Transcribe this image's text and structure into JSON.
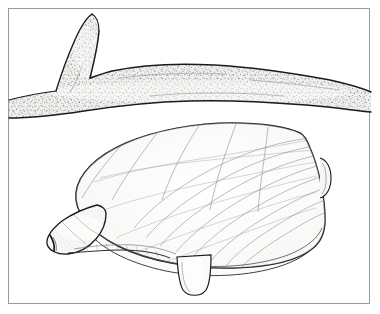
{
  "figure": {
    "title": "Bivalve mollusc with extended siphon beneath a branching twig",
    "domain_kind": "natural-history line illustration",
    "background_color": "#ffffff",
    "frame": {
      "present": true,
      "border_color": "#9a9a9a",
      "border_width_px": 1,
      "inset_left_px": 8,
      "inset_top_px": 8,
      "width_px": 362,
      "height_px": 296
    },
    "ink_color": "#1a1a1a",
    "fill_color": "#f2f2f0",
    "stipple_color": "#3a3a3a",
    "visible_text": [],
    "labels": [],
    "subjects": [
      {
        "id": "branch",
        "name": "branching twig or root",
        "description": "Horizontal forked twig spanning the full width of the frame with a branch rising to the upper left; heavily stippled bark texture with dark irregular upper and lower contour lines.",
        "fill": "#efefed",
        "texture": "dense stipple",
        "position": "upper half of frame"
      },
      {
        "id": "clam-shell",
        "name": "clam shell valve",
        "description": "Large ovate bivalve shell seen in left lateral view, umbo at the right, marked with fine concentric growth lines and radiating striae.",
        "fill": "#f6f6f4",
        "texture": "fine stipple with concentric growth lines",
        "position": "lower half of frame"
      },
      {
        "id": "siphon",
        "name": "siphon",
        "description": "Tapered fleshy siphon projecting to the lower left from the anterior margin of the shell, with a small dark aperture at its tip.",
        "fill": "#f6f6f4",
        "position": "lower left"
      },
      {
        "id": "foot",
        "name": "muscular foot",
        "description": "Short tongue-shaped foot protruding downward from the ventral margin of the shell.",
        "fill": "#f6f6f4",
        "position": "bottom centre"
      },
      {
        "id": "mantle-edge",
        "name": "mantle margin",
        "description": "Thin second outline just inside the ventral shell margin indicating the opposite valve or mantle edge.",
        "position": "ventral margin"
      },
      {
        "id": "umbo",
        "name": "umbo / hinge knob",
        "description": "Small rounded knob at the right posterior edge of the shell where growth lines converge.",
        "position": "right edge of shell"
      }
    ]
  }
}
